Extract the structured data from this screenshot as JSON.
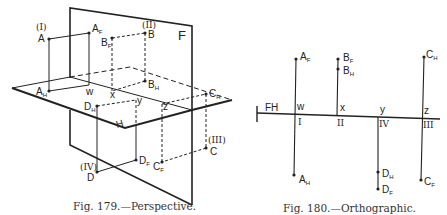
{
  "figures": [
    {
      "id": "fig179",
      "caption": "Fig. 179.—Perspective.",
      "plane_labels": {
        "frontal": "F",
        "horizontal": "H"
      },
      "points": [
        {
          "name": "A",
          "quadrant": "(I)",
          "front": "A",
          "front_sub": "F",
          "horiz": "A",
          "horiz_sub": "H",
          "axis_mark": "w"
        },
        {
          "name": "B",
          "quadrant": "(II)",
          "front": "B",
          "front_sub": "F",
          "horiz": "B",
          "horiz_sub": "H",
          "axis_mark": "x"
        },
        {
          "name": "C",
          "quadrant": "(III)",
          "front": "C",
          "front_sub": "F",
          "horiz": "C",
          "horiz_sub": "H",
          "axis_mark": "z"
        },
        {
          "name": "D",
          "quadrant": "(IV)",
          "front": "D",
          "front_sub": "F",
          "horiz": "D",
          "horiz_sub": "H",
          "axis_mark": "y"
        }
      ]
    },
    {
      "id": "fig180",
      "caption": "Fig. 180.—Orthographic.",
      "ground_line_label": "FH",
      "stations": [
        {
          "mark": "w",
          "roman": "I",
          "above": [
            {
              "l": "A",
              "s": "F"
            }
          ],
          "below": [
            {
              "l": "A",
              "s": "H"
            }
          ]
        },
        {
          "mark": "x",
          "roman": "II",
          "above": [
            {
              "l": "B",
              "s": "F"
            },
            {
              "l": "B",
              "s": "H"
            }
          ],
          "below": []
        },
        {
          "mark": "y",
          "roman": "IV",
          "above": [],
          "below": [
            {
              "l": "D",
              "s": "H"
            },
            {
              "l": "D",
              "s": "F"
            }
          ]
        },
        {
          "mark": "z",
          "roman": "III",
          "above": [
            {
              "l": "C",
              "s": "H"
            }
          ],
          "below": [
            {
              "l": "C",
              "s": "F"
            }
          ]
        }
      ]
    }
  ]
}
